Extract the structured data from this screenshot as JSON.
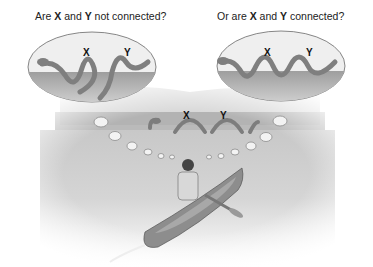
{
  "left_panel": {
    "caption_pre": "Are ",
    "x": "X",
    "and": " and ",
    "y": "Y",
    "caption_post": " not connected?",
    "label_x": "X",
    "label_y": "Y"
  },
  "right_panel": {
    "caption_pre": "Or are ",
    "x": "X",
    "and": " and ",
    "y": "Y",
    "caption_post": " connected?",
    "label_x": "X",
    "label_y": "Y"
  },
  "lake_scene": {
    "label_x": "X",
    "label_y": "Y"
  },
  "colors": {
    "serpent": "#8a8a8a",
    "water": "#b5b5b5",
    "sky": "#e8e8e8",
    "bubble": "#f2f2f2"
  }
}
